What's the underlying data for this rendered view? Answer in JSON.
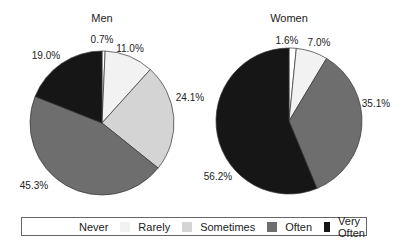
{
  "chart_data": [
    {
      "type": "pie",
      "title": "Men",
      "categories": [
        "Never",
        "Rarely",
        "Sometimes",
        "Often",
        "Very Often"
      ],
      "values": [
        0.7,
        11.0,
        24.1,
        45.3,
        19.0
      ],
      "labels": [
        "0.7%",
        "11.0%",
        "24.1%",
        "45.3%",
        "19.0%"
      ]
    },
    {
      "type": "pie",
      "title": "Women",
      "categories": [
        "Never",
        "Rarely",
        "Sometimes",
        "Often",
        "Very Often"
      ],
      "values": [
        1.6,
        7.0,
        0.0,
        35.1,
        56.2
      ],
      "labels": [
        "1.6%",
        "7.0%",
        "",
        "35.1%",
        "56.2%"
      ]
    }
  ],
  "legend": {
    "position": "bottom",
    "items": [
      {
        "label": "Never",
        "color": "#ffffff"
      },
      {
        "label": "Rarely",
        "color": "#f2f2f2"
      },
      {
        "label": "Sometimes",
        "color": "#d4d4d4"
      },
      {
        "label": "Often",
        "color": "#6e6e6e"
      },
      {
        "label": "Very Often",
        "color": "#161616"
      }
    ]
  },
  "colors": {
    "Never": "#ffffff",
    "Rarely": "#f2f2f2",
    "Sometimes": "#d4d4d4",
    "Often": "#6e6e6e",
    "Very Often": "#161616"
  }
}
